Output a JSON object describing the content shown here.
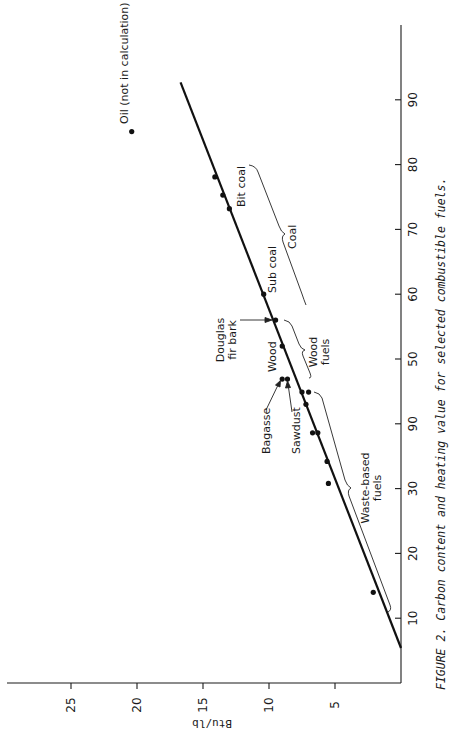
{
  "figure": {
    "caption": "FIGURE 2.  Carbon content and heating value for selected combustible fuels."
  },
  "chart_data": {
    "type": "scatter",
    "orientation": "rotated 90° clockwise (page rotated); carbon content runs along the vertical, Btu/lb along the horizontal",
    "title": "Carbon content and heating value for selected combustible fuels",
    "xlabel": "Btu/lb",
    "ylabel": "",
    "x_axis": {
      "label": "Btu/lb",
      "range": [
        0,
        30
      ],
      "ticks": [
        5,
        10,
        15,
        20,
        25
      ],
      "tick_labels": [
        "5",
        "10",
        "15",
        "20",
        "25"
      ]
    },
    "y_axis": {
      "label": "Carbon content (%)",
      "range": [
        0,
        100
      ],
      "ticks": [
        10,
        20,
        30,
        40,
        50,
        60,
        70,
        80,
        90
      ],
      "tick_labels": [
        "10",
        "20",
        "30",
        "90",
        "50",
        "60",
        "70",
        "80",
        "90"
      ]
    },
    "grid": false,
    "legend": null,
    "points": [
      {
        "group": "Waste-based fuels",
        "carbon": 14.0,
        "btu": 2.1
      },
      {
        "group": "Waste-based fuels",
        "carbon": 30.8,
        "btu": 5.5
      },
      {
        "group": "Waste-based fuels",
        "carbon": 34.2,
        "btu": 5.6
      },
      {
        "group": "Waste-based fuels",
        "carbon": 38.6,
        "btu": 6.3
      },
      {
        "group": "Waste-based fuels",
        "carbon": 38.6,
        "btu": 6.7
      },
      {
        "group": "Waste-based fuels",
        "carbon": 43.0,
        "btu": 7.2
      },
      {
        "group": "Waste-based fuels",
        "carbon": 44.9,
        "btu": 7.0
      },
      {
        "group": "Waste-based fuels",
        "carbon": 44.9,
        "btu": 7.5
      },
      {
        "group": "Wood fuels",
        "label": "Sawdust",
        "carbon": 46.9,
        "btu": 8.6
      },
      {
        "group": "Wood fuels",
        "label": "Bagasse",
        "carbon": 46.9,
        "btu": 9.0
      },
      {
        "group": "Wood fuels",
        "label": "Wood",
        "carbon": 52.0,
        "btu": 9.0
      },
      {
        "group": "Wood fuels",
        "label": "Douglas fir bark",
        "carbon": 56.0,
        "btu": 9.5
      },
      {
        "group": "Coal",
        "label": "Sub coal",
        "carbon": 60.0,
        "btu": 10.4
      },
      {
        "group": "Coal",
        "label": "Bit coal",
        "carbon": 73.2,
        "btu": 13.0
      },
      {
        "group": "Coal",
        "carbon": 75.3,
        "btu": 13.5
      },
      {
        "group": "Coal",
        "carbon": 78.1,
        "btu": 14.1
      },
      {
        "group": "Oil",
        "label": "Oil (not in calculation)",
        "carbon": 85.1,
        "btu": 20.4,
        "excluded": true
      }
    ],
    "fit_line": {
      "start": {
        "carbon": 5.4,
        "btu": 0
      },
      "end": {
        "carbon": 92.7,
        "btu": 16.7
      }
    },
    "annotations": [
      {
        "text": "Oil (not in calculation)"
      },
      {
        "text": "Bit coal"
      },
      {
        "text": "Coal"
      },
      {
        "text": "Sub coal"
      },
      {
        "text": "Douglas fir bark"
      },
      {
        "text": "Wood"
      },
      {
        "text": "Wood fuels"
      },
      {
        "text": "Bagasse"
      },
      {
        "text": "Sawdust"
      },
      {
        "text": "Waste-based fuels"
      }
    ]
  },
  "labels": {
    "oil": "Oil (not in calculation)",
    "bit_coal": "Bit coal",
    "coal": "Coal",
    "sub_coal": "Sub coal",
    "douglas_line1": "Douglas",
    "douglas_line2": "fir bark",
    "wood": "Wood",
    "wood_fuels_line1": "Wood",
    "wood_fuels_line2": "fuels",
    "bagasse": "Bagasse",
    "sawdust": "Sawdust",
    "waste_line1": "Waste-based",
    "waste_line2": "fuels",
    "x_axis_label": "Btu/lb"
  }
}
